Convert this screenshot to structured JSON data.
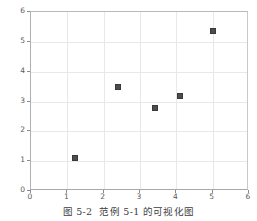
{
  "chart_data": {
    "type": "scatter",
    "title": "",
    "xlabel": "",
    "ylabel": "",
    "xlim": [
      0,
      6
    ],
    "ylim": [
      0,
      6
    ],
    "grid": true,
    "legend": null,
    "marker": {
      "shape": "square",
      "color": "#4d4d4d",
      "edge_color": "#3a3a3a",
      "size_px": 6
    },
    "xticks": [
      0,
      1,
      2,
      3,
      4,
      5,
      6
    ],
    "yticks": [
      0,
      1,
      2,
      3,
      4,
      5,
      6
    ],
    "xtick_labels": [
      "0",
      "1",
      "2",
      "3",
      "4",
      "5",
      "6"
    ],
    "ytick_labels": [
      "0",
      "1",
      "2",
      "3",
      "4",
      "5",
      "6"
    ],
    "series": [
      {
        "name": "data",
        "points": [
          {
            "x": 1.2,
            "y": 1.1
          },
          {
            "x": 2.4,
            "y": 3.48
          },
          {
            "x": 3.4,
            "y": 2.78
          },
          {
            "x": 4.1,
            "y": 3.18
          },
          {
            "x": 5.0,
            "y": 5.35
          }
        ]
      }
    ]
  },
  "caption": {
    "figure_number": "图 5-2",
    "text": "范例 5-1 的可视化图"
  },
  "colors": {
    "grid": "#e8e8e8",
    "axis": "#a8a8a8",
    "tick_text": "#5a5a5a",
    "marker": "#4d4d4d",
    "background": "#ffffff"
  }
}
